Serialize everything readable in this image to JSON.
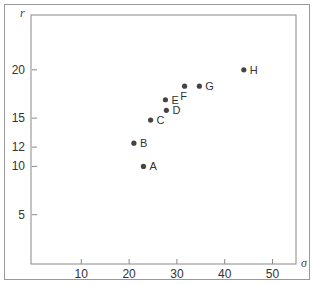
{
  "chart_data": {
    "type": "scatter",
    "title": "",
    "xlabel": "σ",
    "ylabel": "r",
    "xlim": [
      0,
      55
    ],
    "ylim": [
      0,
      25
    ],
    "grid": false,
    "legend": null,
    "x_ticks": [
      10,
      20,
      30,
      40,
      50
    ],
    "y_ticks": [
      5,
      10,
      12,
      15,
      20
    ],
    "points": [
      {
        "label": "A",
        "x": 23,
        "y": 10
      },
      {
        "label": "B",
        "x": 21,
        "y": 12.4
      },
      {
        "label": "C",
        "x": 24.5,
        "y": 14.8
      },
      {
        "label": "D",
        "x": 27.8,
        "y": 15.8
      },
      {
        "label": "E",
        "x": 27.6,
        "y": 16.9
      },
      {
        "label": "F",
        "x": 31.6,
        "y": 18.3
      },
      {
        "label": "G",
        "x": 34.7,
        "y": 18.3
      },
      {
        "label": "H",
        "x": 44,
        "y": 20
      }
    ],
    "colors": {
      "point": "#444444",
      "axis": "#888888",
      "frame": "#9a9a9a"
    }
  }
}
